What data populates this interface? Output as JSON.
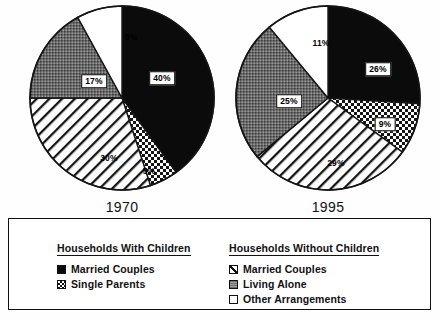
{
  "figure": {
    "background_color": "#ffffff",
    "ink_color": "#111111"
  },
  "chart_data": [
    {
      "type": "pie",
      "title": "1970",
      "categories": [
        "Married Couples (With Children)",
        "Single Parents (With Children)",
        "Married Couples (Without Children)",
        "Living Alone (Without Children)",
        "Other Arrangements (Without Children)"
      ],
      "values": [
        40,
        5,
        30,
        17,
        8
      ],
      "labels": [
        "40%",
        "5%",
        "30%",
        "17%",
        "8%"
      ],
      "patterns": [
        "solid-black",
        "checker-dots",
        "diagonal-hatch",
        "gray-stipple",
        "white"
      ],
      "start_angle_deg": 0,
      "direction": "clockwise",
      "legend_position": "below"
    },
    {
      "type": "pie",
      "title": "1995",
      "categories": [
        "Married Couples (With Children)",
        "Single Parents (With Children)",
        "Married Couples (Without Children)",
        "Living Alone (Without Children)",
        "Other Arrangements (Without Children)"
      ],
      "values": [
        26,
        9,
        29,
        25,
        11
      ],
      "labels": [
        "26%",
        "9%",
        "29%",
        "25%",
        "11%"
      ],
      "patterns": [
        "solid-black",
        "checker-dots",
        "diagonal-hatch",
        "gray-stipple",
        "white"
      ],
      "start_angle_deg": 0,
      "direction": "clockwise",
      "legend_position": "below"
    }
  ],
  "pies": [
    {
      "year": "1970",
      "slices": [
        {
          "label": "40%",
          "value": 40,
          "pattern": "solid-black",
          "boxed": true,
          "x": 134,
          "y": 74
        },
        {
          "label": "5%",
          "value": 5,
          "pattern": "checker-dots",
          "boxed": false,
          "x": 121,
          "y": 167
        },
        {
          "label": "30%",
          "value": 30,
          "pattern": "diagonal-hatch",
          "boxed": false,
          "x": 81,
          "y": 154
        },
        {
          "label": "17%",
          "value": 17,
          "pattern": "gray-stipple",
          "boxed": true,
          "x": 66,
          "y": 77
        },
        {
          "label": "8%",
          "value": 8,
          "pattern": "white",
          "boxed": false,
          "x": 103,
          "y": 33
        }
      ]
    },
    {
      "year": "1995",
      "slices": [
        {
          "label": "26%",
          "value": 26,
          "pattern": "solid-black",
          "boxed": true,
          "x": 144,
          "y": 65
        },
        {
          "label": "9%",
          "value": 9,
          "pattern": "checker-dots",
          "boxed": true,
          "x": 151,
          "y": 120
        },
        {
          "label": "29%",
          "value": 29,
          "pattern": "diagonal-hatch",
          "boxed": false,
          "x": 102,
          "y": 159
        },
        {
          "label": "25%",
          "value": 25,
          "pattern": "gray-stipple",
          "boxed": true,
          "x": 55,
          "y": 97
        },
        {
          "label": "11%",
          "value": 11,
          "pattern": "white",
          "boxed": false,
          "x": 87,
          "y": 39
        }
      ]
    }
  ],
  "legend": {
    "groups": [
      {
        "title": "Households With Children",
        "items": [
          {
            "label": "Married Couples",
            "pattern": "solid-black"
          },
          {
            "label": "Single Parents",
            "pattern": "checker-dots"
          }
        ]
      },
      {
        "title": "Households Without Children",
        "items": [
          {
            "label": "Married Couples",
            "pattern": "diagonal-hatch"
          },
          {
            "label": "Living Alone",
            "pattern": "gray-stipple"
          },
          {
            "label": "Other Arrangements",
            "pattern": "white"
          }
        ]
      }
    ]
  }
}
